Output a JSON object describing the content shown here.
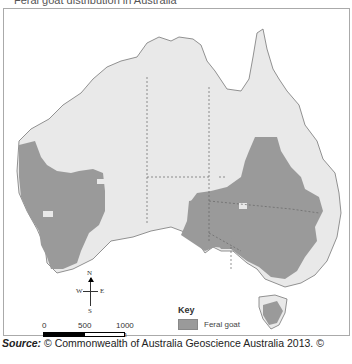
{
  "header": {
    "text": "Feral goat distribution in Australia"
  },
  "map": {
    "land_color": "#e9e9e9",
    "goat_color": "#9a9a9a",
    "border_color": "#666666",
    "compass": {
      "n": "N",
      "s": "S",
      "e": "E",
      "w": "W"
    },
    "scale": {
      "labels": [
        "0",
        "500",
        "1000 km"
      ]
    },
    "key": {
      "title": "Key",
      "items": [
        {
          "label": "Feral goat",
          "color": "#9a9a9a"
        }
      ]
    }
  },
  "caption": {
    "source_label": "Source:",
    "source_text": " © Commonwealth of Australia Geoscience Australia 2013. ©"
  }
}
